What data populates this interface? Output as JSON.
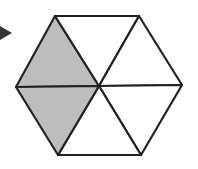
{
  "diagram": {
    "title": "",
    "colors": {
      "background": "#ffffff",
      "stroke": "#222222",
      "shaded": "#bdbdbd",
      "unshaded": "#ffffff",
      "arrow": "#333333"
    },
    "stroke_width": 2.2,
    "center": [
      99,
      86
    ],
    "vertices": {
      "top_left": [
        55,
        16
      ],
      "top_right": [
        139,
        16
      ],
      "right": [
        182,
        85
      ],
      "bottom_right": [
        141,
        155
      ],
      "bottom_left": [
        58,
        155
      ],
      "left": [
        16,
        87
      ]
    },
    "triangles": [
      {
        "id": "upper-left",
        "points": [
          "left",
          "top_left",
          "center"
        ],
        "shaded": true
      },
      {
        "id": "top",
        "points": [
          "top_left",
          "top_right",
          "center"
        ],
        "shaded": false
      },
      {
        "id": "upper-right",
        "points": [
          "top_right",
          "right",
          "center"
        ],
        "shaded": false
      },
      {
        "id": "lower-right",
        "points": [
          "right",
          "bottom_right",
          "center"
        ],
        "shaded": false
      },
      {
        "id": "bottom",
        "points": [
          "bottom_right",
          "bottom_left",
          "center"
        ],
        "shaded": false
      },
      {
        "id": "lower-left",
        "points": [
          "bottom_left",
          "left",
          "center"
        ],
        "shaded": true
      }
    ],
    "shaded_count": 2,
    "total_count": 6,
    "pointer_arrow": {
      "points": [
        [
          0,
          26
        ],
        [
          12,
          33
        ],
        [
          0,
          40
        ]
      ]
    }
  }
}
